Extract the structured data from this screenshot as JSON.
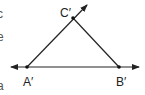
{
  "diagram": {
    "type": "triangle",
    "points": {
      "A": {
        "label": "A′",
        "x": 27,
        "y": 67
      },
      "B": {
        "label": "B′",
        "x": 119,
        "y": 67
      },
      "C": {
        "label": "C′",
        "x": 73,
        "y": 18
      }
    },
    "lines": [
      {
        "name": "line A'B'",
        "from": [
          10,
          67
        ],
        "to": [
          140,
          67
        ],
        "arrows": "both"
      },
      {
        "name": "ray A'C'",
        "from": [
          27,
          67
        ],
        "to": [
          87,
          4
        ],
        "arrows": "end"
      },
      {
        "name": "segment C'B'",
        "from": [
          73,
          18
        ],
        "to": [
          119,
          67
        ],
        "arrows": "none"
      }
    ],
    "stroke_color": "#222222"
  },
  "labels": {
    "c": "C′",
    "a": "A′",
    "b": "B′"
  },
  "edge_text": {
    "t1": "c",
    "t2": "e",
    "t3": "a"
  }
}
